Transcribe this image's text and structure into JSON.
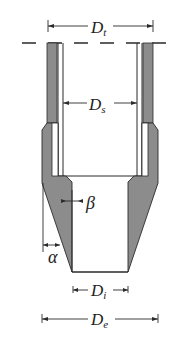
{
  "diagram": {
    "colors": {
      "wall_fill": "#8c8c8c",
      "line": "#2a2a2a",
      "background": "#ffffff"
    },
    "labels": {
      "Dt": {
        "main": "D",
        "sub": "t"
      },
      "Ds": {
        "main": "D",
        "sub": "s"
      },
      "Di": {
        "main": "D",
        "sub": "i"
      },
      "De": {
        "main": "D",
        "sub": "e"
      },
      "beta": "β",
      "alpha": "α"
    }
  }
}
